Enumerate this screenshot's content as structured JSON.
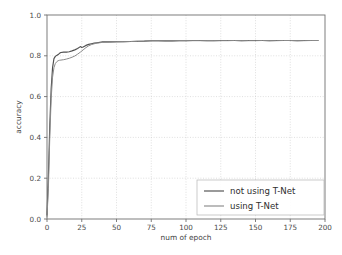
{
  "chart_data": {
    "type": "line",
    "title": "",
    "xlabel": "num of epoch",
    "ylabel": "accuracy",
    "xlim": [
      0,
      200
    ],
    "ylim": [
      0.0,
      1.0
    ],
    "xticks": [
      0,
      25,
      50,
      75,
      100,
      125,
      150,
      175,
      200
    ],
    "xtick_labels": [
      "0",
      "25",
      "50",
      "75",
      "100",
      "125",
      "150",
      "175",
      "200"
    ],
    "yticks": [
      0.0,
      0.2,
      0.4,
      0.6,
      0.8,
      1.0
    ],
    "ytick_labels": [
      "0.0",
      "0.2",
      "0.4",
      "0.6",
      "0.8",
      "1.0"
    ],
    "grid": true,
    "grid_style": "dotted",
    "legend_position": "lower right",
    "series": [
      {
        "name": "not using T-Net",
        "color": "#4f4f4f",
        "x": [
          0,
          1,
          2,
          3,
          4,
          5,
          6,
          7,
          8,
          9,
          10,
          12,
          14,
          16,
          18,
          20,
          22,
          24,
          25,
          26,
          28,
          30,
          32,
          34,
          36,
          38,
          40,
          45,
          50,
          55,
          60,
          65,
          70,
          75,
          80,
          85,
          90,
          95,
          100,
          105,
          110,
          115,
          120,
          125,
          130,
          135,
          140,
          145,
          150,
          155,
          160,
          165,
          170,
          175,
          180,
          185,
          190,
          195
        ],
        "y": [
          0.02,
          0.21,
          0.46,
          0.64,
          0.742,
          0.786,
          0.797,
          0.802,
          0.806,
          0.812,
          0.816,
          0.818,
          0.818,
          0.82,
          0.824,
          0.829,
          0.836,
          0.845,
          0.841,
          0.843,
          0.851,
          0.856,
          0.859,
          0.862,
          0.864,
          0.866,
          0.868,
          0.868,
          0.869,
          0.869,
          0.87,
          0.871,
          0.872,
          0.874,
          0.874,
          0.873,
          0.873,
          0.874,
          0.874,
          0.875,
          0.875,
          0.874,
          0.874,
          0.875,
          0.875,
          0.875,
          0.874,
          0.875,
          0.875,
          0.875,
          0.874,
          0.875,
          0.875,
          0.875,
          0.874,
          0.875,
          0.875,
          0.875
        ]
      },
      {
        "name": "using T-Net",
        "color": "#8a8a8a",
        "x": [
          0,
          1,
          2,
          3,
          4,
          5,
          6,
          7,
          8,
          9,
          10,
          12,
          14,
          16,
          18,
          20,
          22,
          24,
          26,
          28,
          30,
          32,
          34,
          36,
          38,
          40,
          45,
          50,
          55,
          60,
          65,
          70,
          75,
          80,
          85,
          90,
          95,
          100,
          105,
          110,
          115,
          120,
          125,
          130,
          135,
          140,
          145,
          150,
          155,
          160,
          165,
          170,
          175,
          180,
          185,
          190,
          195
        ],
        "y": [
          0.01,
          0.15,
          0.4,
          0.59,
          0.695,
          0.742,
          0.762,
          0.771,
          0.776,
          0.778,
          0.779,
          0.781,
          0.784,
          0.788,
          0.793,
          0.799,
          0.808,
          0.818,
          0.829,
          0.84,
          0.849,
          0.855,
          0.859,
          0.862,
          0.864,
          0.866,
          0.867,
          0.868,
          0.869,
          0.87,
          0.871,
          0.872,
          0.873,
          0.873,
          0.873,
          0.873,
          0.874,
          0.874,
          0.874,
          0.874,
          0.874,
          0.874,
          0.874,
          0.874,
          0.875,
          0.874,
          0.874,
          0.874,
          0.875,
          0.874,
          0.874,
          0.875,
          0.875,
          0.874,
          0.874,
          0.875,
          0.875
        ]
      }
    ],
    "legend": [
      {
        "label": "not using T-Net",
        "color": "#4f4f4f"
      },
      {
        "label": "using T-Net",
        "color": "#8a8a8a"
      }
    ]
  },
  "axes": {
    "plot_left_px": 47,
    "plot_right_px": 325,
    "plot_top_px": 15,
    "plot_bottom_px": 219
  },
  "colors": {
    "background": "#ffffff",
    "axis": "#6f6f6f",
    "grid": "#c9c9c9",
    "text": "#4a4a4a",
    "series_primary": "#4f4f4f",
    "series_secondary": "#8a8a8a"
  }
}
